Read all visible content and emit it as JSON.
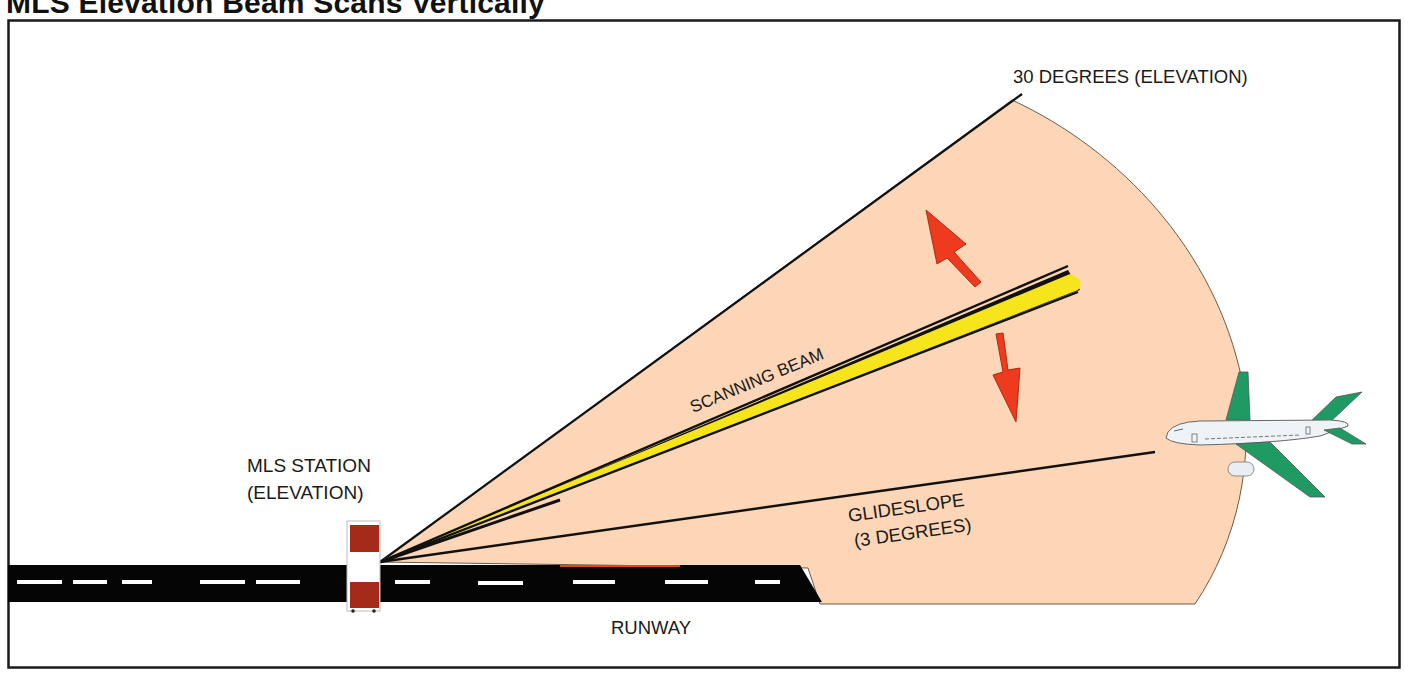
{
  "title": "MLS  Elevation Beam Scans Vertically",
  "labels": {
    "limit_angle": "30 DEGREES  (ELEVATION)",
    "station_line1": "MLS STATION",
    "station_line2": "(ELEVATION)",
    "scanning_beam": "SCANNING BEAM",
    "glideslope_line1": "GLIDESLOPE",
    "glideslope_line2": "(3 DEGREES)",
    "runway": "RUNWAY"
  },
  "angles": {
    "coverage_upper_deg": 30,
    "glideslope_deg": 3
  },
  "colors": {
    "coverage_fill": "#fcd6b6",
    "beam_fill": "#f7e51c",
    "arrow_fill": "#ee3a1d",
    "runway": "#050505",
    "runway_marking": "#ffffff",
    "station_red": "#a52a1a",
    "aircraft_body": "#eef3f8",
    "aircraft_wing": "#1f9a63",
    "frame": "#1a1a1a"
  },
  "icons": {
    "station": "mls-station-icon",
    "aircraft": "aircraft-icon",
    "arrow_up": "scan-up-arrow-icon",
    "arrow_down": "scan-down-arrow-icon"
  }
}
